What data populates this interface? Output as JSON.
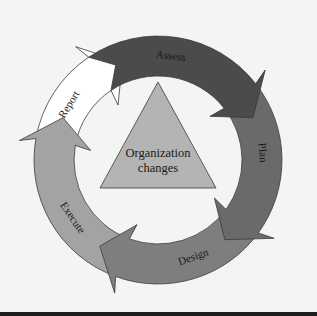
{
  "diagram": {
    "center": {
      "x": 158,
      "y": 160
    },
    "outer_radius": 124,
    "inner_radius": 84,
    "center_label": {
      "line1": "Organization",
      "line2": "changes"
    },
    "center_fill": "#b4b4b4",
    "segments": [
      {
        "label": "Assess",
        "fill": "#4b4b4b",
        "start": -34,
        "end": 52,
        "label_angle": 7
      },
      {
        "label": "Plan",
        "fill": "#6a6a6a",
        "start": 52,
        "end": 126,
        "label_angle": 86
      },
      {
        "label": "Design",
        "fill": "#7e7e7e",
        "start": 126,
        "end": 200,
        "label_angle": 160
      },
      {
        "label": "Execute",
        "fill": "#a3a3a3",
        "start": 200,
        "end": 280,
        "label_angle": 236
      },
      {
        "label": "Report",
        "fill": "#ffffff",
        "start": 280,
        "end": 326,
        "label_angle": 302
      }
    ]
  }
}
